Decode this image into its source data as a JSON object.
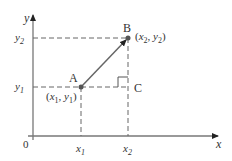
{
  "diagram": {
    "axes": {
      "x_label": "x",
      "y_label": "y",
      "origin_label": "0"
    },
    "ticks": {
      "x1": "x",
      "x1_sub": "1",
      "x2": "x",
      "x2_sub": "2",
      "y1": "y",
      "y1_sub": "1",
      "y2": "y",
      "y2_sub": "2"
    },
    "points": {
      "A": {
        "label": "A",
        "coord_text": "(x1, y1)"
      },
      "B": {
        "label": "B",
        "coord_text": "(x2, y2)"
      },
      "C": {
        "label": "C"
      }
    },
    "colors": {
      "line": "#555555",
      "point": "#555555",
      "text": "#333333"
    }
  }
}
